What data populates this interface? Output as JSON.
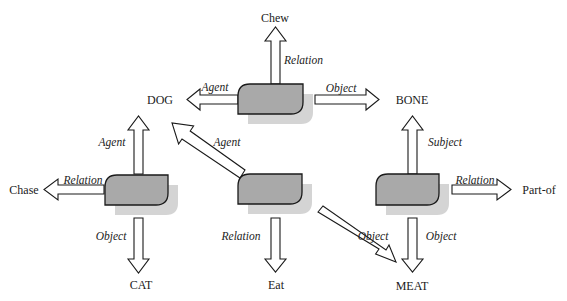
{
  "diagram": {
    "colors": {
      "node_fill": "#a9a9a9",
      "node_shadow": "#d4d4d4",
      "stroke": "#1a1a1a",
      "background": "#ffffff"
    },
    "concepts": {
      "chew": "Chew",
      "dog": "DOG",
      "bone": "BONE",
      "chase": "Chase",
      "cat": "CAT",
      "eat": "Eat",
      "meat": "MEAT",
      "part_of": "Part-of"
    },
    "nodes": [
      {
        "id": "chew-node",
        "links": [
          {
            "role": "Relation",
            "to": "Chew"
          },
          {
            "role": "Agent",
            "to": "DOG"
          },
          {
            "role": "Object",
            "to": "BONE"
          }
        ]
      },
      {
        "id": "chase-node",
        "links": [
          {
            "role": "Agent",
            "to": "DOG"
          },
          {
            "role": "Relation",
            "to": "Chase"
          },
          {
            "role": "Object",
            "to": "CAT"
          }
        ]
      },
      {
        "id": "eat-node",
        "links": [
          {
            "role": "Agent",
            "to": "DOG"
          },
          {
            "role": "Relation",
            "to": "Eat"
          },
          {
            "role": "Object",
            "to": "MEAT"
          }
        ]
      },
      {
        "id": "partof-node",
        "links": [
          {
            "role": "Subject",
            "to": "BONE"
          },
          {
            "role": "Relation",
            "to": "Part-of"
          },
          {
            "role": "Object",
            "to": "MEAT"
          }
        ]
      }
    ],
    "roles": {
      "chew_relation": "Relation",
      "chew_agent": "Agent",
      "chew_object": "Object",
      "chase_agent": "Agent",
      "chase_relation": "Relation",
      "chase_object": "Object",
      "eat_agent": "Agent",
      "eat_relation": "Relation",
      "eat_object": "Object",
      "partof_subject": "Subject",
      "partof_relation": "Relation",
      "partof_object": "Object"
    }
  }
}
